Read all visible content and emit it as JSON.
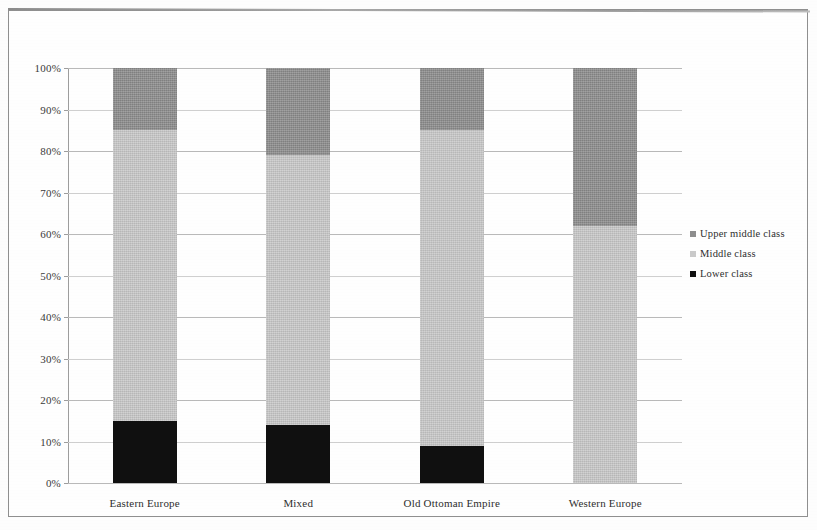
{
  "chart_data": {
    "type": "bar",
    "subtype": "stacked-100-percent",
    "title": "",
    "xlabel": "",
    "ylabel": "",
    "ylim": [
      0,
      100
    ],
    "ytick_labels": [
      "0%",
      "10%",
      "20%",
      "30%",
      "40%",
      "50%",
      "60%",
      "70%",
      "80%",
      "90%",
      "100%"
    ],
    "ytick_values": [
      0,
      10,
      20,
      30,
      40,
      50,
      60,
      70,
      80,
      90,
      100
    ],
    "grid": true,
    "legend_position": "right",
    "categories": [
      "Eastern Europe",
      "Mixed",
      "Old Ottoman Empire",
      "Western Europe"
    ],
    "series": [
      {
        "name": "Lower class",
        "color": "#101010",
        "values": [
          15,
          14,
          9,
          0
        ]
      },
      {
        "name": "Middle class",
        "color": "#c9c9c9",
        "values": [
          70,
          65,
          76,
          62
        ]
      },
      {
        "name": "Upper middle class",
        "color": "#8d8d8d",
        "values": [
          15,
          21,
          15,
          38
        ]
      }
    ],
    "legend_entries": [
      {
        "label": "Upper middle class",
        "color": "#8d8d8d"
      },
      {
        "label": "Middle class",
        "color": "#c9c9c9"
      },
      {
        "label": "Lower class",
        "color": "#101010"
      }
    ]
  }
}
